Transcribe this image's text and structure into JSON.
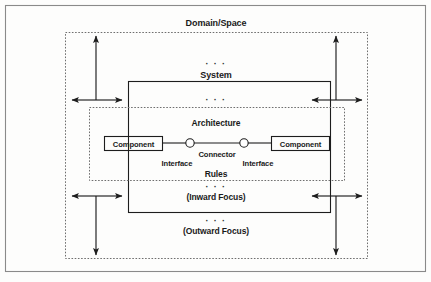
{
  "figure": {
    "title": "Domain/Space",
    "background_color": "#fdfdfc",
    "line_color": "#1d1d1d",
    "dashed_color": "#6e6e6e",
    "frame_color": "#8a8a8a"
  },
  "labels": {
    "domain_space": "Domain/Space",
    "system": "System",
    "architecture": "Architecture",
    "component_left": "Component",
    "component_right": "Component",
    "connector": "Connector",
    "interface_left": "Interface",
    "interface_right": "Interface",
    "rules": "Rules",
    "inward_focus": "(Inward Focus)",
    "outward_focus": "(Outward Focus)",
    "ellipsis": "· · ·"
  },
  "ellipses": {
    "above_system": "· · ·",
    "below_system": "· · ·",
    "above_inward": "· · ·",
    "above_outward": "· · ·"
  }
}
